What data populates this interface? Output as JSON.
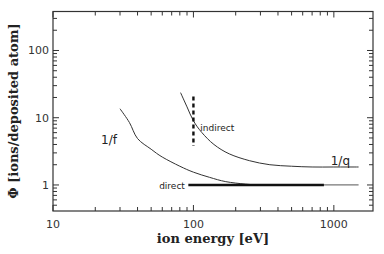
{
  "chart_data": {
    "type": "line",
    "title": "",
    "xlabel": "ion energy [eV]",
    "ylabel": "Φ [ions/deposited atom]",
    "xscale": "log",
    "yscale": "log",
    "xlim": [
      10,
      1900
    ],
    "ylim": [
      0.41,
      380
    ],
    "grid": false,
    "xticks": [
      {
        "v": 10,
        "label": "10"
      },
      {
        "v": 100,
        "label": "100"
      },
      {
        "v": 1000,
        "label": "1000"
      }
    ],
    "yticks": [
      {
        "v": 1,
        "label": "1"
      },
      {
        "v": 10,
        "label": "10"
      },
      {
        "v": 100,
        "label": "100"
      }
    ],
    "series": [
      {
        "name": "1/f",
        "style": "thin",
        "x": [
          30,
          35,
          40,
          50,
          60,
          80,
          100,
          130,
          170,
          235,
          300,
          400
        ],
        "y": [
          13.6,
          8.5,
          4.9,
          3.4,
          2.6,
          1.9,
          1.55,
          1.3,
          1.12,
          1.03,
          1.0,
          1.0
        ]
      },
      {
        "name": "1/q",
        "style": "thin",
        "x": [
          81,
          90,
          100,
          115,
          140,
          180,
          250,
          350,
          500,
          700,
          1000,
          1500
        ],
        "y": [
          23.6,
          14.5,
          9.0,
          6.0,
          4.0,
          2.9,
          2.3,
          2.0,
          1.9,
          1.85,
          1.85,
          1.85
        ]
      },
      {
        "name": "direct",
        "style": "thick",
        "x": [
          92,
          850
        ],
        "y": [
          1.0,
          1.0
        ]
      },
      {
        "name": "direct-extension",
        "style": "gray",
        "x": [
          850,
          1500
        ],
        "y": [
          1.0,
          1.0
        ]
      },
      {
        "name": "indirect",
        "style": "dashed",
        "x": [
          100,
          100
        ],
        "y": [
          20.6,
          3.8
        ]
      }
    ],
    "annotations": [
      {
        "text": "1/f",
        "x": 22,
        "y": 4.6,
        "size": "large"
      },
      {
        "text": "indirect",
        "x": 112,
        "y": 7.3,
        "size": "small"
      },
      {
        "text": "1/q",
        "x": 950,
        "y": 2.3,
        "size": "large"
      },
      {
        "text": "direct",
        "x": 57,
        "y": 1.0,
        "size": "small"
      }
    ]
  }
}
